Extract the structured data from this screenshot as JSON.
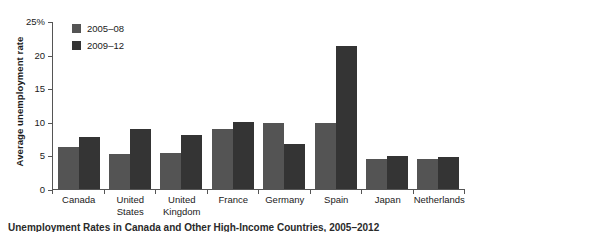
{
  "chart_data": {
    "type": "bar",
    "title": "",
    "xlabel": "",
    "ylabel": "Average unemployment rate",
    "ylim": [
      0,
      25
    ],
    "yticks": [
      "0",
      "5",
      "10",
      "15",
      "20",
      "25%"
    ],
    "ytick_values": [
      0,
      5,
      10,
      15,
      20,
      25
    ],
    "grid": false,
    "legend_position": "top-left",
    "categories": [
      "Canada",
      "United States",
      "United Kingdom",
      "France",
      "Germany",
      "Spain",
      "Japan",
      "Netherlands"
    ],
    "series": [
      {
        "name": "2005–08",
        "color": "#545454",
        "values": [
          6.3,
          5.2,
          5.3,
          8.9,
          9.8,
          9.8,
          4.4,
          4.5
        ]
      },
      {
        "name": "2009–12",
        "color": "#343434",
        "values": [
          7.8,
          9.0,
          8.0,
          9.9,
          6.7,
          21.3,
          4.9,
          4.7
        ]
      }
    ]
  },
  "caption": "Unemployment Rates in Canada and Other High-Income Countries, 2005–2012"
}
